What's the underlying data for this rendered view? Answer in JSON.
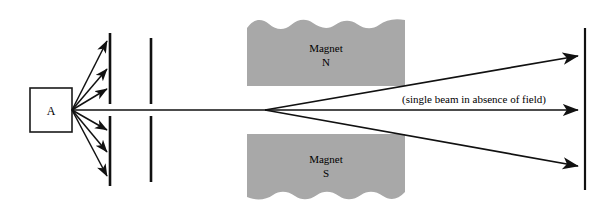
{
  "figure": {
    "background_color": "#ffffff",
    "width": 611,
    "height": 219
  },
  "source": {
    "label": "A",
    "name": "source-box",
    "box": {
      "x": 30,
      "y": 88,
      "width": 42,
      "height": 44
    },
    "stroke_color": "#1a1a1a",
    "fill_color": "#ffffff",
    "emission_point": {
      "x": 72,
      "y": 110
    }
  },
  "collimators": {
    "stroke_color": "#111111",
    "plates": [
      {
        "name": "first-collimator-plate",
        "x": 110,
        "upper": {
          "y_top": 33,
          "y_bottom": 104
        },
        "lower": {
          "y_top": 116,
          "y_bottom": 186
        }
      },
      {
        "name": "second-collimator-plate",
        "x": 151,
        "upper": {
          "y_top": 38,
          "y_bottom": 104
        },
        "lower": {
          "y_top": 116,
          "y_bottom": 182
        }
      }
    ]
  },
  "blocked_rays": {
    "name": "blocked-ray-fan",
    "color": "#111111",
    "count": 6,
    "upper_endpoints_y": [
      40,
      68,
      88
    ],
    "lower_endpoints_y": [
      130,
      152,
      176
    ],
    "endpoint_x": 110
  },
  "magnets": [
    {
      "name": "magnet-north",
      "label_line1": "Magnet",
      "label_line2": "N",
      "fill_color": "#a8a8a8",
      "x": 247,
      "y": 18,
      "width": 158,
      "height": 68,
      "wavy_edge": "top"
    },
    {
      "name": "magnet-south",
      "label_line1": "Magnet",
      "label_line2": "S",
      "fill_color": "#a8a8a8",
      "x": 247,
      "y": 134,
      "width": 158,
      "height": 68,
      "wavy_edge": "bottom"
    }
  ],
  "beams": {
    "color": "#111111",
    "split_point": {
      "x": 265,
      "y": 110
    },
    "annotation": "(single beam in absence of field)",
    "annotation_position": {
      "x": 402,
      "y": 103
    },
    "paths": [
      {
        "name": "beam-deflected-up",
        "end_x": 583,
        "end_y": 55
      },
      {
        "name": "beam-undeflected",
        "end_x": 583,
        "end_y": 110
      },
      {
        "name": "beam-deflected-down",
        "end_x": 583,
        "end_y": 166
      }
    ]
  },
  "screen": {
    "name": "detector-screen",
    "x": 585,
    "y_top": 28,
    "y_bottom": 190,
    "stroke_color": "#111111"
  }
}
